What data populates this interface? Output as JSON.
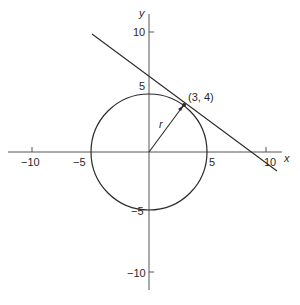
{
  "diagram": {
    "type": "geometry",
    "colors": {
      "stroke": "#2a2a2a",
      "axis": "#555555",
      "background": "#ffffff"
    },
    "axes": {
      "x_label": "x",
      "y_label": "y",
      "x_ticks": [
        {
          "value": -10,
          "label": "−10"
        },
        {
          "value": -5,
          "label": "−5"
        },
        {
          "value": 5,
          "label": "5"
        },
        {
          "value": 10,
          "label": "10"
        }
      ],
      "y_ticks": [
        {
          "value": 10,
          "label": "10"
        },
        {
          "value": 5,
          "label": "5"
        },
        {
          "value": -5,
          "label": "−5"
        },
        {
          "value": -10,
          "label": "−10"
        }
      ]
    },
    "circle": {
      "center": [
        0,
        0
      ],
      "radius": 5
    },
    "point": {
      "coords": [
        3,
        4
      ],
      "label": "(3, 4)"
    },
    "radius_label": "r",
    "tangent_line": {
      "equation": "3x + 4y = 25",
      "through": [
        3,
        4
      ]
    }
  }
}
